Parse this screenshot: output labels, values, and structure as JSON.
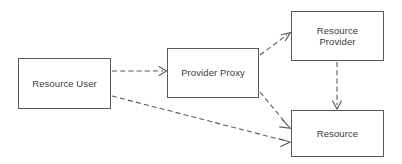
{
  "diagram": {
    "type": "flow-diagram",
    "width": 402,
    "height": 164,
    "background_color": "#ffffff",
    "line_color": "#5a5a5a",
    "text_color": "#3a3a3a",
    "nodes": [
      {
        "id": "resource-user",
        "label": "Resource User",
        "x": 18,
        "y": 58,
        "width": 93,
        "height": 51
      },
      {
        "id": "provider-proxy",
        "label": "Provider Proxy",
        "x": 167,
        "y": 48,
        "width": 92,
        "height": 50
      },
      {
        "id": "resource-provider",
        "label": "Resource\nProvider",
        "x": 291,
        "y": 11,
        "width": 93,
        "height": 50
      },
      {
        "id": "resource",
        "label": "Resource",
        "x": 291,
        "y": 110,
        "width": 93,
        "height": 47
      }
    ],
    "edges": [
      {
        "id": "user-to-proxy",
        "from": "resource-user",
        "to": "provider-proxy",
        "style": "dashed",
        "arrowhead": "open",
        "x1": 112,
        "y1": 71,
        "x2": 166,
        "y2": 71
      },
      {
        "id": "user-to-resource",
        "from": "resource-user",
        "to": "resource",
        "style": "dashed",
        "arrowhead": "open",
        "x1": 112,
        "y1": 96,
        "x2": 290,
        "y2": 142
      },
      {
        "id": "proxy-to-provider",
        "from": "provider-proxy",
        "to": "resource-provider",
        "style": "dashed",
        "arrowhead": "open",
        "x1": 260,
        "y1": 55,
        "x2": 290,
        "y2": 33
      },
      {
        "id": "proxy-to-resource",
        "from": "provider-proxy",
        "to": "resource",
        "style": "dashed",
        "arrowhead": "open",
        "x1": 260,
        "y1": 92,
        "x2": 290,
        "y2": 128
      },
      {
        "id": "provider-to-resource",
        "from": "resource-provider",
        "to": "resource",
        "style": "dashed",
        "arrowhead": "open",
        "x1": 337,
        "y1": 62,
        "x2": 337,
        "y2": 109
      }
    ]
  }
}
